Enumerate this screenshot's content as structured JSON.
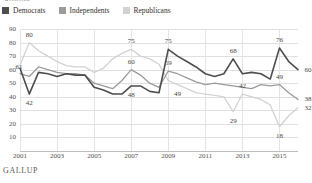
{
  "title_sliver": "Approve",
  "source": "GALLUP",
  "legend": {
    "items": [
      {
        "label": "Democrats",
        "color": "#4e4e4e"
      },
      {
        "label": "Independents",
        "color": "#9b9b9b"
      },
      {
        "label": "Republicans",
        "color": "#d2d2d2"
      }
    ]
  },
  "chart_data": {
    "type": "line",
    "title": "Approve",
    "xlabel": "",
    "ylabel": "",
    "ylim": [
      0,
      90
    ],
    "yticks": [
      10,
      20,
      30,
      40,
      50,
      60,
      70,
      80,
      90
    ],
    "xticks": [
      "2001",
      "2003",
      "2005",
      "2007",
      "2009",
      "2011",
      "2013",
      "2015"
    ],
    "grid": true,
    "legend_position": "top-left",
    "x": [
      2001,
      2001.5,
      2002,
      2002.5,
      2003,
      2003.5,
      2004,
      2004.5,
      2005,
      2005.5,
      2006,
      2006.5,
      2007,
      2007.5,
      2008,
      2008.5,
      2009,
      2009.5,
      2010,
      2010.5,
      2011,
      2011.5,
      2012,
      2012.5,
      2013,
      2013.5,
      2014,
      2014.5,
      2015,
      2015.5,
      2016
    ],
    "series": [
      {
        "name": "Democrats",
        "color": "#4e4e4e",
        "values": [
          61,
          42,
          58,
          57,
          55,
          57,
          56,
          56,
          47,
          45,
          42,
          42,
          48,
          48,
          44,
          43,
          75,
          70,
          66,
          62,
          57,
          55,
          57,
          68,
          57,
          58,
          57,
          53,
          76,
          66,
          60
        ]
      },
      {
        "name": "Independents",
        "color": "#9b9b9b",
        "values": [
          57,
          55,
          62,
          60,
          58,
          57,
          57,
          56,
          50,
          48,
          46,
          52,
          60,
          56,
          50,
          47,
          59,
          57,
          54,
          51,
          49,
          50,
          49,
          48,
          47,
          46,
          49,
          48,
          49,
          43,
          38
        ]
      },
      {
        "name": "Republicans",
        "color": "#d2d2d2",
        "values": [
          63,
          80,
          74,
          70,
          66,
          63,
          62,
          62,
          58,
          61,
          68,
          72,
          75,
          70,
          68,
          64,
          52,
          49,
          46,
          43,
          42,
          41,
          40,
          29,
          42,
          40,
          38,
          34,
          18,
          26,
          32
        ]
      }
    ],
    "point_labels": [
      {
        "text": "80",
        "series": "Republicans",
        "x": 2001.5,
        "y": 80,
        "pos": "above"
      },
      {
        "text": "61",
        "series": "Democrats",
        "x": 2001,
        "y": 61,
        "pos": "left"
      },
      {
        "text": "42",
        "series": "Democrats",
        "x": 2001.5,
        "y": 42,
        "pos": "below"
      },
      {
        "text": "75",
        "series": "Republicans",
        "x": 2007,
        "y": 75,
        "pos": "above"
      },
      {
        "text": "60",
        "series": "Independents",
        "x": 2007,
        "y": 60,
        "pos": "above"
      },
      {
        "text": "48",
        "series": "Democrats",
        "x": 2007,
        "y": 48,
        "pos": "below"
      },
      {
        "text": "75",
        "series": "Democrats",
        "x": 2009,
        "y": 75,
        "pos": "above"
      },
      {
        "text": "59",
        "series": "Independents",
        "x": 2009,
        "y": 59,
        "pos": "above"
      },
      {
        "text": "49",
        "series": "Republicans",
        "x": 2009.5,
        "y": 49,
        "pos": "below"
      },
      {
        "text": "68",
        "series": "Democrats",
        "x": 2012.5,
        "y": 68,
        "pos": "above"
      },
      {
        "text": "42",
        "series": "Republicans",
        "x": 2013,
        "y": 42,
        "pos": "above"
      },
      {
        "text": "29",
        "series": "Republicans",
        "x": 2012.5,
        "y": 29,
        "pos": "below"
      },
      {
        "text": "76",
        "series": "Democrats",
        "x": 2015,
        "y": 76,
        "pos": "above"
      },
      {
        "text": "49",
        "series": "Independents",
        "x": 2015,
        "y": 49,
        "pos": "above"
      },
      {
        "text": "18",
        "series": "Republicans",
        "x": 2015,
        "y": 18,
        "pos": "below"
      },
      {
        "text": "60",
        "series": "Democrats",
        "x": 2016,
        "y": 60,
        "pos": "right"
      },
      {
        "text": "38",
        "series": "Independents",
        "x": 2016,
        "y": 38,
        "pos": "right"
      },
      {
        "text": "32",
        "series": "Republicans",
        "x": 2016,
        "y": 32,
        "pos": "right"
      }
    ]
  }
}
